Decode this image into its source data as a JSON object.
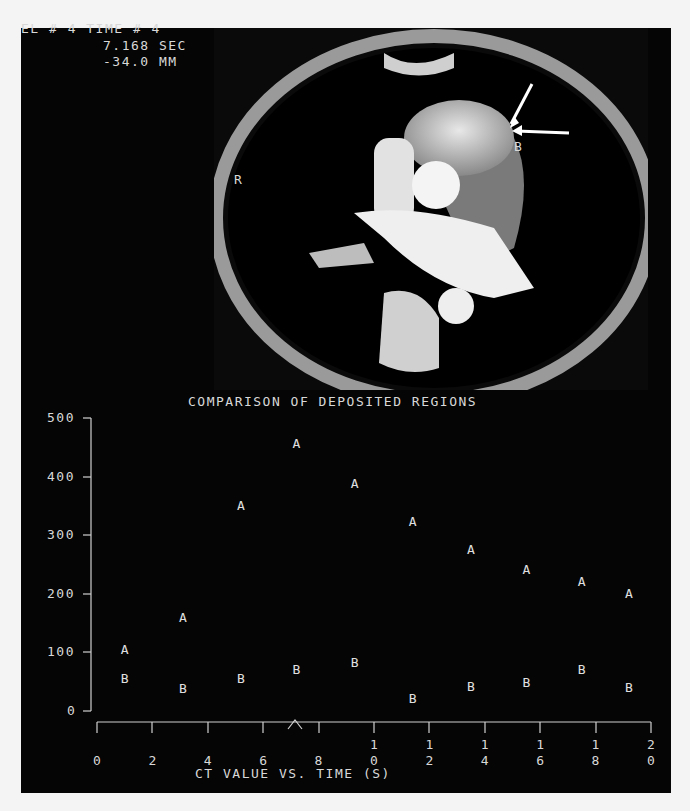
{
  "header": {
    "line1": "EL # 4 TIME # 4",
    "line2": "7.168 SEC",
    "line3": "-34.0 MM"
  },
  "ct_image": {
    "label_side": "R",
    "label_region": "B",
    "label_corner": "C",
    "arrows": 2
  },
  "chart_data": {
    "type": "scatter",
    "title": "COMPARISON OF DEPOSITED REGIONS",
    "xlabel": "CT VALUE VS. TIME (S)",
    "ylabel": "",
    "xlim": [
      0,
      20
    ],
    "ylim": [
      0,
      500
    ],
    "x_ticks": [
      "0",
      "2",
      "4",
      "6",
      "8",
      "10",
      "12",
      "14",
      "16",
      "18",
      "20"
    ],
    "y_ticks": [
      "0",
      "100",
      "200",
      "300",
      "400",
      "500"
    ],
    "grid": false,
    "marker_note": "caret marker on x-axis at ~7.2 s",
    "series": [
      {
        "name": "A",
        "x": [
          1.0,
          3.1,
          5.2,
          7.2,
          9.3,
          11.4,
          13.5,
          15.5,
          17.5,
          19.2
        ],
        "values": [
          106,
          160,
          352,
          458,
          389,
          324,
          276,
          242,
          222,
          201
        ]
      },
      {
        "name": "B",
        "x": [
          1.0,
          3.1,
          5.2,
          7.2,
          9.3,
          11.4,
          13.5,
          15.5,
          17.5,
          19.2
        ],
        "values": [
          56,
          39,
          56,
          72,
          84,
          22,
          43,
          49,
          72,
          41
        ]
      }
    ]
  }
}
